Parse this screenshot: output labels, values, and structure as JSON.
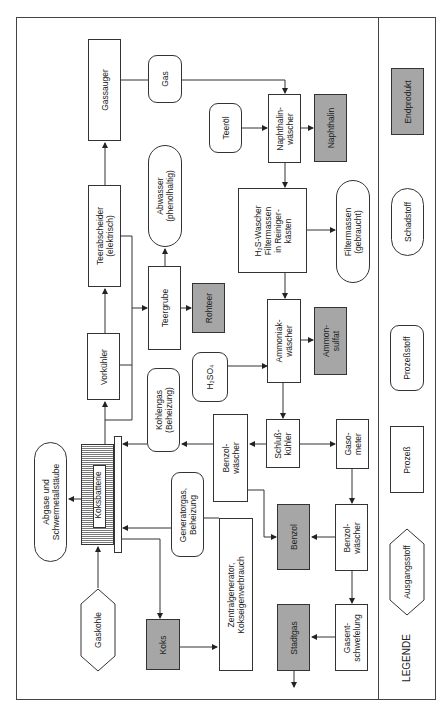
{
  "diagram": {
    "orientation": "rotated 90deg counterclockwise",
    "colors": {
      "line": "#333333",
      "endproduct_fill": "#a6a6a6",
      "background": "#ffffff"
    },
    "nodes": {
      "gassauger": "Gassauger",
      "gas": "Gas",
      "teeroel": "Teeröl",
      "naphthalinwaescher": "Naphthalin-\nwäscher",
      "naphthalin": "Naphthalin",
      "teerabscheider": "Teerabscheider\n(elektrisch)",
      "abwasser": "Abwasser\n(phenolhaltig)",
      "h2s_waescher": "H₂S-Wascher\nFiltermassen\nin Reiniger-\nkästen",
      "filtermassen": "Filtermassen\n(gebraucht)",
      "vorkuehler": "Vorkühler",
      "teergrube": "Teergrube",
      "rohteer": "Rohteer",
      "ammoniakwaescher": "Ammoniak-\nwäscher",
      "ammonsulfat": "Ammon-\nsulfat",
      "h2so4": "H₂SO₄",
      "kohlengas": "Kohlengas\n(Beheizung)",
      "schlusskuehler": "Schluß-\nkühler",
      "gasometer": "Gaso-\nmeter",
      "benzolwaescher_1": "Benzol-\nwäscher",
      "benzolwaescher_2": "Benzol-\nwäscher",
      "benzol": "Benzol",
      "abgase": "Abgase und\nSchwermetallstäube",
      "koksbatterie": "Koksbatterie",
      "generatorgas": "Generatorgas,\nBeheizung",
      "zentralgenerator": "Zentralgenerator,\nKokseigenverbrauch",
      "gaskohle": "Gaskohle",
      "koks": "Koks",
      "stadtgas": "Stadtgas",
      "gasentschwefelung": "Gasent-\nschwefelung"
    },
    "legend": {
      "title": "LEGENDE",
      "items": [
        {
          "shape": "gray-rect",
          "label": "Endprodukt"
        },
        {
          "shape": "pill",
          "label": "Schadstoff"
        },
        {
          "shape": "rounded-rect",
          "label": "Prozeßstoff"
        },
        {
          "shape": "rect",
          "label": "Prozeß"
        },
        {
          "shape": "hexagon",
          "label": "Ausgangsstoff"
        }
      ]
    }
  }
}
